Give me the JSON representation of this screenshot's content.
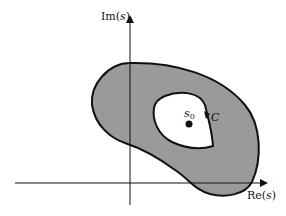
{
  "diagram": {
    "axes": {
      "x_label": "Re(s)",
      "y_label": "Im(s)",
      "x_label_prefix": "Re",
      "y_label_prefix": "Im",
      "var": "s"
    },
    "region": {
      "fill": "#9a9a9a",
      "stroke": "#111111",
      "description": "annular shaded region with hole"
    },
    "contour": {
      "label": "C"
    },
    "point": {
      "label": "s",
      "subscript": "0"
    }
  }
}
